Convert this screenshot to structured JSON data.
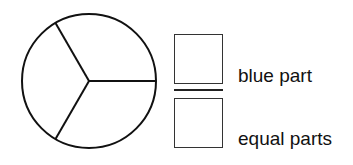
{
  "diagram": {
    "circle": {
      "center": [
        89,
        81
      ],
      "radius": 67,
      "equal_parts": 3,
      "shaded_parts": 0,
      "stroke_color": "#111111"
    },
    "fraction": {
      "numerator_box": "",
      "denominator_box": ""
    },
    "labels": {
      "numerator": "blue part",
      "denominator": "equal parts"
    }
  }
}
